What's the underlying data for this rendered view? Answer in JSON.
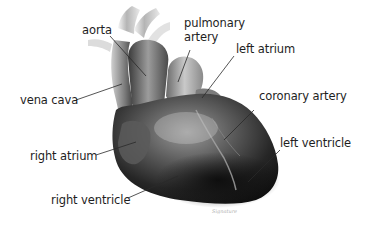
{
  "diagram": {
    "labels": {
      "aorta": "aorta",
      "pulmonary_artery": "pulmonary\nartery",
      "left_atrium": "left atrium",
      "vena_cava": "vena cava",
      "coronary_artery": "coronary artery",
      "right_atrium": "right atrium",
      "left_ventricle": "left ventricle",
      "right_ventricle": "right ventricle"
    },
    "signature": "Signature",
    "colors": {
      "background": "#ffffff",
      "label_text": "#1e1e1e",
      "leader_line": "#2a2a2a",
      "heart_dark": "#151515",
      "heart_mid": "#555555",
      "heart_light": "#bdbdbd"
    }
  }
}
